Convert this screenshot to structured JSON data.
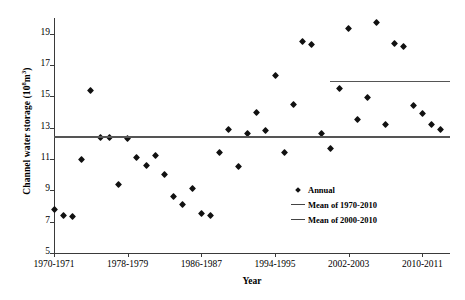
{
  "chart_data": {
    "type": "scatter",
    "title": "",
    "xlabel": "Year",
    "ylabel": "Channel water storage (10⁸m³)",
    "ylabel_prefix": "Channel water storage (10",
    "ylabel_sup": "8",
    "ylabel_suffix": "m",
    "ylabel_sup2": "3",
    "ylabel_close": ")",
    "ylim": [
      5,
      20
    ],
    "yticks": [
      5,
      7,
      9,
      11,
      13,
      15,
      17,
      19
    ],
    "xlim": [
      1970,
      2013
    ],
    "xticks": [
      1970,
      1978,
      1986,
      1994,
      2002,
      2010
    ],
    "xtick_labels": [
      "1970-1971",
      "1978-1979",
      "1986-1987",
      "1994-1995",
      "2002-2003",
      "2010-2011"
    ],
    "grid": false,
    "legend_position": "center-right-inside",
    "series": [
      {
        "name": "Annual",
        "type": "scatter",
        "marker": "diamond",
        "color": "#111111",
        "x": [
          1970,
          1971,
          1972,
          1973,
          1974,
          1975,
          1976,
          1977,
          1978,
          1979,
          1980,
          1981,
          1982,
          1983,
          1984,
          1985,
          1986,
          1987,
          1988,
          1989,
          1990,
          1991,
          1992,
          1993,
          1994,
          1995,
          1996,
          1997,
          1998,
          1999,
          2000,
          2001,
          2002,
          2003,
          2004,
          2005,
          2006,
          2007,
          2008,
          2009,
          2010,
          2011,
          2012
        ],
        "values": [
          7.8,
          7.4,
          7.3,
          11.0,
          15.4,
          12.4,
          12.4,
          9.4,
          12.3,
          11.1,
          10.6,
          11.2,
          10.0,
          8.6,
          8.1,
          9.1,
          7.5,
          7.4,
          11.4,
          12.9,
          10.5,
          12.6,
          14.0,
          12.8,
          16.3,
          11.4,
          14.5,
          18.5,
          18.3,
          12.6,
          11.7,
          15.5,
          19.3,
          13.5,
          14.9,
          19.7,
          13.2,
          18.4,
          18.2,
          14.4,
          13.9,
          13.2,
          12.9
        ]
      },
      {
        "name": "Mean of 1970-2010",
        "type": "hline",
        "value": 12.45,
        "color": "#555555",
        "x_start": 1970,
        "x_end": 2013
      },
      {
        "name": "Mean of 2000-2010",
        "type": "hline",
        "value": 16.0,
        "color": "#555555",
        "x_start": 2000,
        "x_end": 2013
      }
    ]
  },
  "legend": {
    "items": [
      {
        "label": "Annual",
        "key": "diamond-marker"
      },
      {
        "label": "Mean of 1970-2010",
        "key": "line-marker"
      },
      {
        "label": "Mean of 2000-2010",
        "key": "line-marker"
      }
    ]
  }
}
